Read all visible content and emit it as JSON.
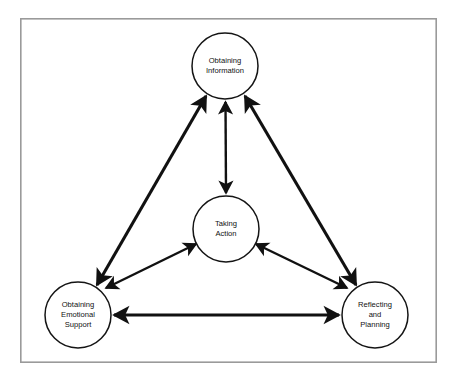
{
  "diagram": {
    "frame": {
      "x": 20,
      "y": 18,
      "width": 417,
      "height": 345,
      "border_color": "#9a9a9a",
      "background_color": "#ffffff"
    },
    "style": {
      "circle_stroke_color": "#141414",
      "arrow_color": "#111111",
      "text_color": "#111111",
      "circle_radius": 33
    },
    "nodes": [
      {
        "id": "obtaining-information",
        "name": "obtaining-information",
        "lines": [
          "Obtaining",
          "Information"
        ],
        "cx": 225,
        "cy": 66,
        "r": 33
      },
      {
        "id": "taking-action",
        "name": "taking-action",
        "lines": [
          "Taking",
          "Action"
        ],
        "cx": 226,
        "cy": 229,
        "r": 33
      },
      {
        "id": "obtaining-emotional-support",
        "name": "obtaining-emotional-support",
        "lines": [
          "Obtaining",
          "Emotional",
          "Support"
        ],
        "cx": 78,
        "cy": 315,
        "r": 33
      },
      {
        "id": "reflecting-and-planning",
        "name": "reflecting-and-planning",
        "lines": [
          "Reflecting",
          "and",
          "Planning"
        ],
        "cx": 375,
        "cy": 315,
        "r": 33
      }
    ],
    "connectors": [
      {
        "id": "information-to-emotional-support",
        "from": "obtaining-information",
        "to": "obtaining-emotional-support",
        "bidirectional": true,
        "weight": "thick"
      },
      {
        "id": "information-to-reflecting",
        "from": "obtaining-information",
        "to": "reflecting-and-planning",
        "bidirectional": true,
        "weight": "thick"
      },
      {
        "id": "emotional-support-to-reflecting",
        "from": "obtaining-emotional-support",
        "to": "reflecting-and-planning",
        "bidirectional": true,
        "weight": "thick"
      },
      {
        "id": "information-to-taking-action",
        "from": "obtaining-information",
        "to": "taking-action",
        "bidirectional": true,
        "weight": "thin"
      },
      {
        "id": "taking-action-to-emotional-support",
        "from": "taking-action",
        "to": "obtaining-emotional-support",
        "bidirectional": true,
        "weight": "thin"
      },
      {
        "id": "taking-action-to-reflecting",
        "from": "taking-action",
        "to": "reflecting-and-planning",
        "bidirectional": true,
        "weight": "thin"
      }
    ]
  }
}
